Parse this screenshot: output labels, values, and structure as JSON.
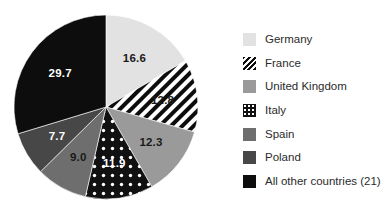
{
  "chart_data": {
    "type": "pie",
    "title": "",
    "subtitle": "",
    "xlabel": "",
    "ylabel": "",
    "grid": false,
    "legend_position": "right",
    "start_angle_deg": 0,
    "direction": "clockwise",
    "categories": [
      "Germany",
      "France",
      "United Kingdom",
      "Italy",
      "Spain",
      "Poland",
      "All other countries (21)"
    ],
    "values": [
      16.6,
      12.8,
      12.3,
      11.9,
      9.0,
      7.7,
      29.7
    ],
    "data_labels": [
      "16.6",
      "12.8",
      "12.3",
      "11.9",
      "9.0",
      "7.7",
      "29.7"
    ],
    "slices": [
      {
        "name": "Germany",
        "value": 16.6,
        "label": "16.6",
        "fill": "#e2e2e2",
        "pattern": "solid",
        "label_color": "#1a1a1a"
      },
      {
        "name": "France",
        "value": 12.8,
        "label": "12.8",
        "fill": "#ffffff",
        "pattern": "diagonal-stripes",
        "label_color": "#1a1a1a"
      },
      {
        "name": "United Kingdom",
        "value": 12.3,
        "label": "12.3",
        "fill": "#9a9a9a",
        "pattern": "solid",
        "label_color": "#1a1a1a"
      },
      {
        "name": "Italy",
        "value": 11.9,
        "label": "11.9",
        "fill": "#111111",
        "pattern": "white-dots",
        "label_color": "#ffffff"
      },
      {
        "name": "Spain",
        "value": 9.0,
        "label": "9.0",
        "fill": "#6e6e6e",
        "pattern": "solid",
        "label_color": "#1a1a1a"
      },
      {
        "name": "Poland",
        "value": 7.7,
        "label": "7.7",
        "fill": "#474747",
        "pattern": "solid",
        "label_color": "#ffffff"
      },
      {
        "name": "All other countries (21)",
        "value": 29.7,
        "label": "29.7",
        "fill": "#0d0d0d",
        "pattern": "solid",
        "label_color": "#ffffff"
      }
    ],
    "total": 100.0
  },
  "legend": {
    "items": [
      {
        "label": "Germany",
        "swatch": "light-gray-swatch"
      },
      {
        "label": "France",
        "swatch": "diagonal-stripes-swatch"
      },
      {
        "label": "United Kingdom",
        "swatch": "medium-gray-swatch"
      },
      {
        "label": "Italy",
        "swatch": "dotted-dark-swatch"
      },
      {
        "label": "Spain",
        "swatch": "dark-gray-swatch"
      },
      {
        "label": "Poland",
        "swatch": "darker-gray-swatch"
      },
      {
        "label": "All other countries (21)",
        "swatch": "black-swatch"
      }
    ]
  },
  "colors": {
    "background": "#ffffff",
    "germany": "#e2e2e2",
    "united_kingdom": "#9a9a9a",
    "spain": "#6e6e6e",
    "poland": "#474747",
    "italy": "#111111",
    "all_other": "#0d0d0d",
    "text": "#2b2b2b"
  }
}
